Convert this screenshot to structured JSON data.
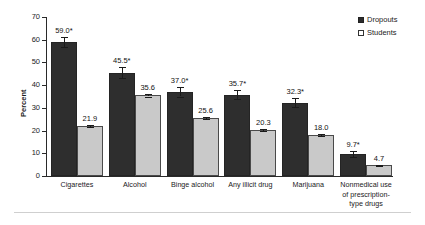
{
  "chart_data": {
    "type": "bar",
    "title": "",
    "subtitle": "",
    "xlabel": "",
    "ylabel": "Percent",
    "ylim": [
      0,
      70
    ],
    "yticks": [
      0,
      10,
      20,
      30,
      40,
      50,
      60,
      70
    ],
    "ytick_labels": [
      "0",
      "10",
      "20",
      "30",
      "40",
      "50",
      "60",
      "70"
    ],
    "grid": false,
    "legend_position": "top-right",
    "categories": [
      "Cigarettes",
      "Alcohol",
      "Binge alcohol",
      "Any illicit drug",
      "Marijuana",
      "Nonmedical use of prescription-type drugs"
    ],
    "category_label_lines": [
      [
        "Cigarettes"
      ],
      [
        "Alcohol"
      ],
      [
        "Binge alcohol"
      ],
      [
        "Any illicit drug"
      ],
      [
        "Marijuana"
      ],
      [
        "Nonmedical use",
        "of prescription-",
        "type drugs"
      ]
    ],
    "series": [
      {
        "name": "Dropouts",
        "color": "#2e2e2e",
        "values": [
          59.0,
          45.5,
          37.0,
          35.7,
          32.3,
          9.7
        ],
        "labels": [
          "59.0*",
          "45.5*",
          "37.0*",
          "35.7*",
          "32.3*",
          "9.7*"
        ],
        "errors": [
          2.1,
          2.3,
          2.0,
          2.0,
          2.1,
          1.3
        ]
      },
      {
        "name": "Students",
        "color": "#c9c9c9",
        "values": [
          21.9,
          35.6,
          25.6,
          20.3,
          18.0,
          4.7
        ],
        "labels": [
          "21.9",
          "35.6",
          "25.6",
          "20.3",
          "18.0",
          "4.7"
        ],
        "errors": [
          0.5,
          0.6,
          0.5,
          0.5,
          0.5,
          0.3
        ]
      }
    ],
    "annotations": {
      "significance_marker": "*"
    }
  },
  "legend": {
    "items": [
      {
        "label": "Dropouts",
        "swatch": "filled-dark-square"
      },
      {
        "label": "Students",
        "swatch": "open-square"
      }
    ]
  }
}
